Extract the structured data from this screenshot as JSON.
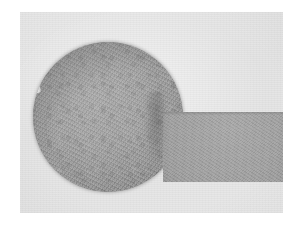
{
  "image": {
    "kind": "micrograph",
    "modality": "brightfield-light-microscopy",
    "caption": "",
    "canvas": {
      "width_px": 298,
      "height_px": 227,
      "border_color": "#ffffff"
    },
    "field": {
      "label": "",
      "left_px": 20,
      "top_px": 12,
      "width_px": 263,
      "height_px": 201,
      "background_color": "#e7e7e7"
    }
  },
  "specimens": [
    {
      "id": "primary-cell",
      "label": "",
      "shape": "sphere",
      "center_x_px": 108,
      "center_y_px": 117,
      "diameter_px": 150,
      "body_color": "#9d9d9d",
      "rim_color": "#6f6f6f",
      "texture": "granular-cytoplasm",
      "features": [
        {
          "id": "cell-edge-notch",
          "label": "",
          "kind": "bright-edge-notch",
          "x_px": 34,
          "y_px": 87
        },
        {
          "id": "primary-cell-inner-arc",
          "label": "",
          "kind": "faint-internal-boundary",
          "x_px": 120,
          "y_px": 140
        }
      ]
    },
    {
      "id": "secondary-structure",
      "label": "",
      "shape": "partial-dome-cropped-at-frame-edge",
      "left_px": 163,
      "top_px": 112,
      "width_px": 145,
      "height_px": 70,
      "body_color": "#9d9d9d",
      "rim_color": "#767676",
      "texture": "granular-cytoplasm",
      "top_edge": "flat-horizontal"
    }
  ],
  "junction": {
    "id": "contact-junction",
    "label": "",
    "kind": "contact-interface",
    "x_px": 160,
    "y_px": 120
  },
  "palette": {
    "frame_white": "#ffffff",
    "field_gray": "#e7e7e7",
    "specimen_mid_gray": "#9d9d9d",
    "specimen_dark_rim": "#6f6f6f",
    "specimen_highlight": "#a8a8a8"
  },
  "annotations": {
    "scale_bar": "",
    "labels": [],
    "overlay_text": ""
  }
}
